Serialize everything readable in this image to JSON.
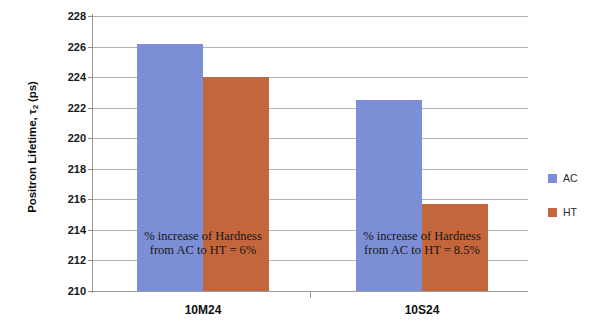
{
  "chart_data": {
    "type": "bar",
    "title": "",
    "subtitle": "",
    "xlabel": "",
    "ylabel": "Positron Lifetime, τ₂ (ps)",
    "ylabel_main": "Positron Lifetime, τ",
    "ylabel_sub": "2",
    "ylabel_unit": " (ps)",
    "categories": [
      "10M24",
      "10S24"
    ],
    "series": [
      {
        "name": "AC",
        "color": "#7b8ed6",
        "values": [
          226.2,
          222.5
        ]
      },
      {
        "name": "HT",
        "color": "#c4663c",
        "values": [
          224.0,
          215.7
        ]
      }
    ],
    "ylim": [
      210,
      228
    ],
    "ytick_step": 2,
    "ytick_labels": [
      "228",
      "226",
      "224",
      "222",
      "220",
      "218",
      "216",
      "214",
      "212",
      "210"
    ],
    "ytick_values": [
      228,
      226,
      224,
      222,
      220,
      218,
      216,
      214,
      212,
      210
    ],
    "grid": true,
    "grid_axis": "y",
    "legend_position": "right",
    "annotations": [
      {
        "category": "10M24",
        "line1": "% increase of Hardness",
        "line2": "from AC to HT = 6%",
        "value": "6%"
      },
      {
        "category": "10S24",
        "line1": "% increase of Hardness",
        "line2": "from AC to HT = 8.5%",
        "value": "8.5%"
      }
    ]
  },
  "legend": {
    "items": [
      {
        "label": "AC",
        "color": "#7b8ed6"
      },
      {
        "label": "HT",
        "color": "#c4663c"
      }
    ]
  },
  "colors": {
    "ac": "#7b8ed6",
    "ht": "#c4663c",
    "gridline": "#b4b4b4",
    "axis": "#9a9a9a",
    "text": "#161616"
  }
}
